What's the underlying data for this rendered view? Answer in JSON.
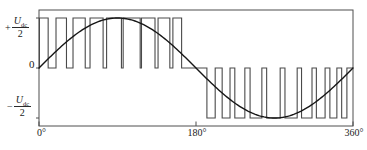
{
  "colors": {
    "background": "#ffffff",
    "frame": "#4f4f4f",
    "pwm": "#4a4a4a",
    "sine": "#161616",
    "text": "#1b1b1b"
  },
  "axis": {
    "y_top": {
      "sign": "+",
      "symbol": "U",
      "subscript": "dc",
      "denominator": "2"
    },
    "y_zero": "0",
    "y_bottom": {
      "sign": "−",
      "symbol": "U",
      "subscript": "dc",
      "denominator": "2"
    }
  },
  "chart_data": {
    "type": "line",
    "x_unit": "degrees",
    "x_range": [
      0,
      360
    ],
    "x_ticks": [
      {
        "deg": 0,
        "label": "0°"
      },
      {
        "deg": 180,
        "label": "180°"
      },
      {
        "deg": 360,
        "label": "360°"
      }
    ],
    "y_unit": "Udc/2",
    "y_range": [
      -1,
      1
    ],
    "y_tick_labels": [
      "+Udc/2",
      "0",
      "−Udc/2"
    ],
    "grid": false,
    "legend": false,
    "series": [
      {
        "name": "sine-reference",
        "kind": "sine",
        "amplitude": 1,
        "period_deg": 360,
        "phase_deg": 0
      },
      {
        "name": "pwm-output",
        "kind": "pulse-train",
        "baseline": 0,
        "pulses": [
          {
            "start_deg": 0.5,
            "end_deg": 10.5,
            "level": 1
          },
          {
            "start_deg": 19.5,
            "end_deg": 31.5,
            "level": 1
          },
          {
            "start_deg": 39,
            "end_deg": 53,
            "level": 1
          },
          {
            "start_deg": 58.5,
            "end_deg": 73.5,
            "level": 1
          },
          {
            "start_deg": 77.5,
            "end_deg": 94.5,
            "level": 1
          },
          {
            "start_deg": 96.5,
            "end_deg": 116,
            "level": 1
          },
          {
            "start_deg": 117.5,
            "end_deg": 133,
            "level": 1
          },
          {
            "start_deg": 136.5,
            "end_deg": 150,
            "level": 1
          },
          {
            "start_deg": 153.5,
            "end_deg": 163.5,
            "level": 1
          },
          {
            "start_deg": 192.5,
            "end_deg": 202,
            "level": -1
          },
          {
            "start_deg": 210,
            "end_deg": 219,
            "level": -1
          },
          {
            "start_deg": 224.5,
            "end_deg": 236,
            "level": -1
          },
          {
            "start_deg": 242,
            "end_deg": 255.5,
            "level": -1
          },
          {
            "start_deg": 261,
            "end_deg": 276.5,
            "level": -1
          },
          {
            "start_deg": 282,
            "end_deg": 296,
            "level": -1
          },
          {
            "start_deg": 301,
            "end_deg": 313,
            "level": -1
          },
          {
            "start_deg": 318,
            "end_deg": 328,
            "level": -1
          },
          {
            "start_deg": 333.5,
            "end_deg": 341.5,
            "level": -1
          },
          {
            "start_deg": 347,
            "end_deg": 353,
            "level": -1
          }
        ]
      }
    ]
  }
}
